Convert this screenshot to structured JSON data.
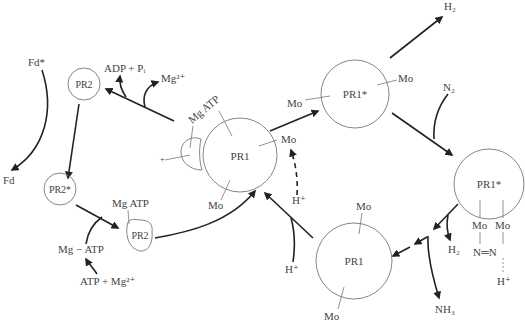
{
  "diagram": {
    "type": "nitrogenase-cycle",
    "nodes": [
      {
        "id": "pr2-top",
        "label": "PR2"
      },
      {
        "id": "pr2-star",
        "label": "PR2*"
      },
      {
        "id": "pr2-mgatp",
        "label": "PR2",
        "attached": "Mg ATP"
      },
      {
        "id": "pr1-center",
        "label": "PR1",
        "attached": [
          "Mg ATP",
          "Mo",
          "Mo"
        ]
      },
      {
        "id": "pr1-star-top",
        "label": "PR1*",
        "attached": [
          "Mo",
          "Mo"
        ]
      },
      {
        "id": "pr1-star-right",
        "label": "PR1*",
        "attached": [
          "Mo",
          "Mo"
        ],
        "bound": "N=N",
        "proton": "H+"
      },
      {
        "id": "pr1-bottom",
        "label": "PR1",
        "attached": [
          "Mo",
          "Mo"
        ]
      }
    ],
    "labels": {
      "fd_star": "Fd*",
      "fd": "Fd",
      "adp_pi": "ADP + Pᵢ",
      "mg2_top": "Mg²⁺",
      "mg_atp_left": "Mg ATP",
      "mg_atp_center": "Mg ATP",
      "mg_minus_atp": "Mg − ATP",
      "atp_plus_mg": "ATP + Mg²⁺",
      "mo": "Mo",
      "h_plus": "H⁺",
      "h2_top": "H₂",
      "h2_right": "H₂",
      "n2": "N₂",
      "nh3": "NH₃",
      "n_eq_n": "N═N",
      "pr1": "PR1",
      "pr1_star": "PR1*",
      "pr2": "PR2",
      "pr2_star": "PR2*",
      "plus_small": "+"
    }
  }
}
